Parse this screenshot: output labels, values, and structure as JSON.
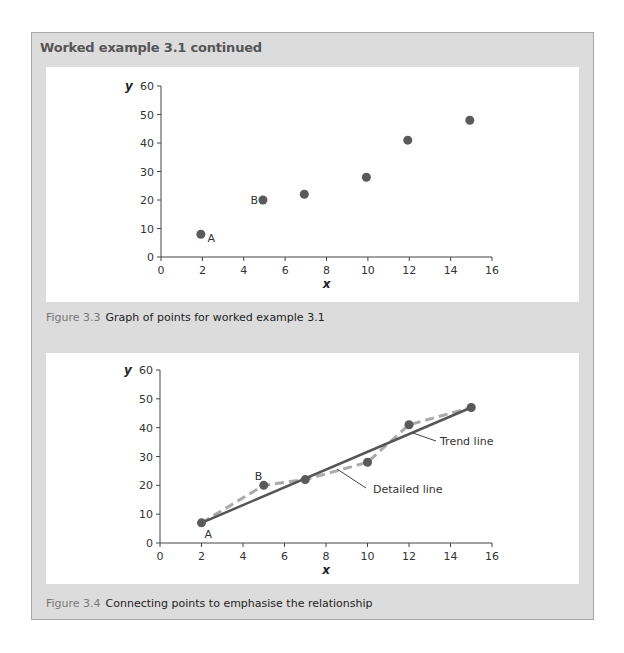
{
  "box": {
    "title": "Worked example 3.1 continued"
  },
  "figures": [
    {
      "label": "Figure 3.3",
      "caption": "Graph of points for worked example 3.1"
    },
    {
      "label": "Figure 3.4",
      "caption": "Connecting points to emphasise the relationship"
    }
  ],
  "colors": {
    "frame_bg": "#dcdcdc",
    "frame_border": "#a8a8a8",
    "point": "#5a5a5a",
    "trend_line": "#555555",
    "detailed_line": "#aaaaaa",
    "axis": "#444444"
  },
  "chart_data": [
    {
      "type": "scatter",
      "title": "Graph of points for worked example 3.1",
      "xlabel": "x",
      "ylabel": "y",
      "xlim": [
        0,
        16
      ],
      "ylim": [
        0,
        60
      ],
      "xticks": [
        0,
        2,
        4,
        6,
        8,
        10,
        12,
        14,
        16
      ],
      "yticks": [
        0,
        10,
        20,
        30,
        40,
        50,
        60
      ],
      "grid": false,
      "series": [
        {
          "name": "points",
          "x": [
            2,
            5,
            7,
            10,
            12,
            15
          ],
          "y": [
            8,
            20,
            22,
            28,
            41,
            48
          ]
        }
      ],
      "annotations": [
        {
          "text": "A",
          "x": 2,
          "y": 8
        },
        {
          "text": "B",
          "x": 5,
          "y": 20
        }
      ]
    },
    {
      "type": "line",
      "title": "Connecting points to emphasise the relationship",
      "xlabel": "x",
      "ylabel": "y",
      "xlim": [
        0,
        16
      ],
      "ylim": [
        0,
        60
      ],
      "xticks": [
        0,
        2,
        4,
        6,
        8,
        10,
        12,
        14,
        16
      ],
      "yticks": [
        0,
        10,
        20,
        30,
        40,
        50,
        60
      ],
      "grid": false,
      "series": [
        {
          "name": "Detailed line",
          "style": "dashed",
          "x": [
            2,
            5,
            7,
            10,
            12,
            15
          ],
          "y": [
            7,
            20,
            22,
            28,
            41,
            47
          ]
        },
        {
          "name": "Trend line",
          "style": "solid",
          "x": [
            2,
            15
          ],
          "y": [
            7,
            47
          ]
        }
      ],
      "annotations": [
        {
          "text": "A",
          "x": 2,
          "y": 7
        },
        {
          "text": "B",
          "x": 5,
          "y": 20
        },
        {
          "text": "Trend line"
        },
        {
          "text": "Detailed line"
        }
      ]
    }
  ]
}
